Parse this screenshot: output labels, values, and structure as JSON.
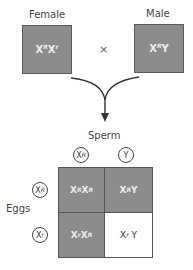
{
  "parents": {
    "female": {
      "label": "Female",
      "genotype": {
        "base": "X",
        "sup": "R",
        "base2": "X",
        "sup2": "r"
      }
    },
    "cross_symbol": "×",
    "male": {
      "label": "Male",
      "genotype": {
        "base": "X",
        "sup": "R",
        "base2": "Y"
      }
    }
  },
  "punnett": {
    "sperm_label": "Sperm",
    "eggs_label": "Eggs",
    "sperm": [
      {
        "base": "X",
        "sup": "R"
      },
      {
        "base": "Y",
        "sup": ""
      }
    ],
    "eggs": [
      {
        "base": "X",
        "sup": "R"
      },
      {
        "base": "X",
        "sup": "r"
      }
    ],
    "cells": [
      [
        {
          "a": "X",
          "as": "R",
          "b": "X",
          "bs": "R",
          "shaded": true
        },
        {
          "a": "X",
          "as": "R",
          "b": "Y",
          "bs": "",
          "shaded": true
        }
      ],
      [
        {
          "a": "X",
          "as": "r",
          "b": "X",
          "bs": "R",
          "shaded": true
        },
        {
          "a": "X",
          "as": "r",
          "b": "Y",
          "bs": "",
          "shaded": false
        }
      ]
    ]
  },
  "colors": {
    "shaded_fill": "#8c8c8c",
    "border": "#555555",
    "shaded_text": "#ececec"
  }
}
